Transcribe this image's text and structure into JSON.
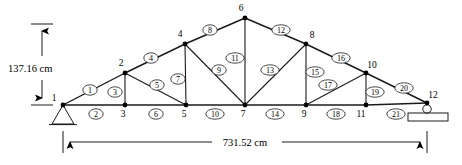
{
  "figure": {
    "kind": "truss-structural-diagram",
    "background_color": "#ffffff",
    "line_color": "#1a1a1a"
  },
  "dimensions": {
    "height_label": "137.16 cm",
    "span_label": "731.52 cm"
  },
  "joints": [
    {
      "id": "1",
      "label": "1",
      "x": 63,
      "y": 105,
      "label_dx": -9,
      "label_dy": -4
    },
    {
      "id": "2",
      "label": "2",
      "x": 125,
      "y": 73,
      "label_dx": -4,
      "label_dy": -7
    },
    {
      "id": "3",
      "label": "3",
      "x": 125,
      "y": 105,
      "label_dx": -2,
      "label_dy": 12
    },
    {
      "id": "4",
      "label": "4",
      "x": 185,
      "y": 44,
      "label_dx": -5,
      "label_dy": -7
    },
    {
      "id": "5",
      "label": "5",
      "x": 186,
      "y": 105,
      "label_dx": -2,
      "label_dy": 12
    },
    {
      "id": "6",
      "label": "6",
      "x": 245,
      "y": 18,
      "label_dx": -4,
      "label_dy": -7
    },
    {
      "id": "7",
      "label": "7",
      "x": 245,
      "y": 105,
      "label_dx": -2,
      "label_dy": 12
    },
    {
      "id": "8",
      "label": "8",
      "x": 306,
      "y": 44,
      "label_dx": 6,
      "label_dy": -6
    },
    {
      "id": "9",
      "label": "9",
      "x": 306,
      "y": 105,
      "label_dx": -2,
      "label_dy": 12
    },
    {
      "id": "10",
      "label": "10",
      "x": 366,
      "y": 73,
      "label_dx": 6,
      "label_dy": -5
    },
    {
      "id": "11",
      "label": "11",
      "x": 366,
      "y": 105,
      "label_dx": -5,
      "label_dy": 12
    },
    {
      "id": "12",
      "label": "12",
      "x": 427,
      "y": 103,
      "label_dx": 6,
      "label_dy": -5
    }
  ],
  "members": [
    {
      "id": "1",
      "label": "1",
      "from": "1",
      "to": "2",
      "lx": 90,
      "ly": 90,
      "type": "top-chord"
    },
    {
      "id": "2",
      "label": "2",
      "from": "1",
      "to": "3",
      "lx": 96,
      "ly": 114,
      "type": "bottom-chord"
    },
    {
      "id": "3",
      "label": "3",
      "from": "2",
      "to": "3",
      "lx": 115,
      "ly": 92,
      "type": "vertical"
    },
    {
      "id": "4",
      "label": "4",
      "from": "2",
      "to": "4",
      "lx": 151,
      "ly": 58,
      "type": "top-chord"
    },
    {
      "id": "5",
      "label": "5",
      "from": "2",
      "to": "5",
      "lx": 157,
      "ly": 85,
      "type": "diagonal"
    },
    {
      "id": "6",
      "label": "6",
      "from": "3",
      "to": "5",
      "lx": 156,
      "ly": 114,
      "type": "bottom-chord"
    },
    {
      "id": "7",
      "label": "7",
      "from": "4",
      "to": "5",
      "lx": 178,
      "ly": 79,
      "type": "vertical"
    },
    {
      "id": "8",
      "label": "8",
      "from": "4",
      "to": "6",
      "lx": 210,
      "ly": 30,
      "type": "top-chord"
    },
    {
      "id": "9",
      "label": "9",
      "from": "4",
      "to": "7",
      "lx": 219,
      "ly": 70,
      "type": "diagonal"
    },
    {
      "id": "10",
      "label": "10",
      "from": "5",
      "to": "7",
      "lx": 215,
      "ly": 114,
      "type": "bottom-chord"
    },
    {
      "id": "11",
      "label": "11",
      "from": "6",
      "to": "7",
      "lx": 235,
      "ly": 58,
      "type": "vertical"
    },
    {
      "id": "12",
      "label": "12",
      "from": "6",
      "to": "8",
      "lx": 281,
      "ly": 30,
      "type": "top-chord"
    },
    {
      "id": "13",
      "label": "13",
      "from": "7",
      "to": "8",
      "lx": 270,
      "ly": 70,
      "type": "diagonal"
    },
    {
      "id": "14",
      "label": "14",
      "from": "7",
      "to": "9",
      "lx": 275,
      "ly": 114,
      "type": "bottom-chord"
    },
    {
      "id": "15",
      "label": "15",
      "from": "8",
      "to": "9",
      "lx": 315,
      "ly": 72,
      "type": "vertical"
    },
    {
      "id": "16",
      "label": "16",
      "from": "8",
      "to": "10",
      "lx": 341,
      "ly": 58,
      "type": "top-chord"
    },
    {
      "id": "17",
      "label": "17",
      "from": "9",
      "to": "10",
      "lx": 328,
      "ly": 85,
      "type": "diagonal"
    },
    {
      "id": "18",
      "label": "18",
      "from": "9",
      "to": "11",
      "lx": 336,
      "ly": 114,
      "type": "bottom-chord"
    },
    {
      "id": "19",
      "label": "19",
      "from": "10",
      "to": "11",
      "lx": 375,
      "ly": 92,
      "type": "vertical"
    },
    {
      "id": "20",
      "label": "20",
      "from": "10",
      "to": "12",
      "lx": 404,
      "ly": 88,
      "type": "top-chord"
    },
    {
      "id": "21",
      "label": "21",
      "from": "11",
      "to": "12",
      "lx": 396,
      "ly": 114,
      "type": "bottom-chord"
    }
  ],
  "supports": [
    {
      "id": "pin-support",
      "type": "pinned",
      "joint": "1",
      "x": 63,
      "y": 105
    },
    {
      "id": "roller-support",
      "type": "roller",
      "joint": "12",
      "x": 427,
      "y": 103
    }
  ],
  "height_dim": {
    "x": 42,
    "top_y": 24,
    "bottom_y": 105,
    "tick_half_width": 11,
    "text_x": 8,
    "text_y": 68
  },
  "span_dim": {
    "y": 142,
    "left_x": 63,
    "right_x": 427,
    "tick_top": 132,
    "tick_bottom": 152,
    "text_x": 245,
    "text_y": 146
  }
}
